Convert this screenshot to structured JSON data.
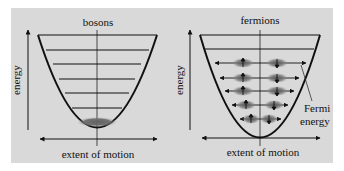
{
  "diagram": {
    "background_color": "#d9d9d9",
    "left_panel": {
      "title": "bosons",
      "y_axis_label": "energy",
      "x_axis_label": "extent of motion",
      "energy_levels": 7,
      "particles": "all in ground state"
    },
    "right_panel": {
      "title": "fermions",
      "y_axis_label": "energy",
      "x_axis_label": "extent of motion",
      "energy_levels": 7,
      "filled_levels": 5,
      "annotation": [
        "Fermi",
        "energy"
      ],
      "spins": [
        "up",
        "down"
      ]
    }
  }
}
